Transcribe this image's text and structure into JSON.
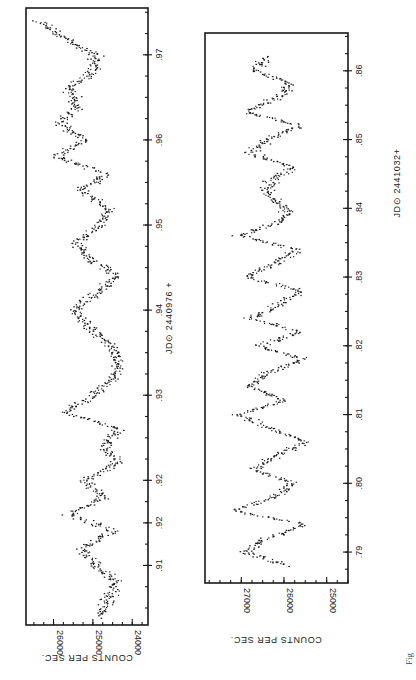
{
  "figure": {
    "orientation": "rotated 90 degrees clockwise",
    "caption_fragment": "Fig"
  },
  "chart_data": [
    {
      "type": "scatter",
      "title": "",
      "xlabel": "JD⊙ 2440976 +",
      "ylabel": "COUNTS PER SEC.",
      "x_ticks": [
        ".91",
        ".92",
        ".92",
        ".93",
        ".94",
        ".95",
        ".96",
        ".97"
      ],
      "x_tick_values": [
        0.91,
        0.915,
        0.92,
        0.93,
        0.94,
        0.95,
        0.96,
        0.97
      ],
      "y_ticks": [
        "24000",
        "25000",
        "26000"
      ],
      "xlim": [
        0.903,
        0.9755
      ],
      "ylim": [
        23600,
        26700
      ],
      "grid": false,
      "legend": null,
      "description": "Light curve showing quasi-periodic oscillations of ~0.01 day with amplitude ~800 counts/sec around 25000",
      "series": [
        {
          "name": "Run 1",
          "x": [
            0.904,
            0.906,
            0.908,
            0.91,
            0.912,
            0.914,
            0.916,
            0.918,
            0.92,
            0.922,
            0.924,
            0.926,
            0.928,
            0.93,
            0.932,
            0.934,
            0.936,
            0.938,
            0.94,
            0.942,
            0.944,
            0.946,
            0.948,
            0.95,
            0.952,
            0.954,
            0.956,
            0.958,
            0.96,
            0.962,
            0.964,
            0.966,
            0.968,
            0.97,
            0.972,
            0.974
          ],
          "y": [
            24800,
            24600,
            24400,
            24900,
            25300,
            24500,
            25600,
            24700,
            25200,
            24400,
            24700,
            24300,
            25700,
            25000,
            24500,
            24300,
            24600,
            25100,
            25500,
            24900,
            24400,
            25100,
            25400,
            24800,
            24600,
            25300,
            24700,
            25900,
            25200,
            25800,
            25400,
            25600,
            25000,
            24900,
            25700,
            26400
          ]
        }
      ]
    },
    {
      "type": "scatter",
      "title": "",
      "xlabel": "JD⊙ 2441032+",
      "ylabel": "COUNTS PER SEC.",
      "x_ticks": [
        ".79",
        ".80",
        ".81",
        ".82",
        ".83",
        ".84",
        ".85",
        ".86"
      ],
      "x_tick_values": [
        0.79,
        0.8,
        0.81,
        0.82,
        0.83,
        0.84,
        0.85,
        0.86
      ],
      "y_ticks": [
        "25000",
        "26000",
        "27000"
      ],
      "xlim": [
        0.7855,
        0.8655
      ],
      "ylim": [
        24500,
        27850
      ],
      "grid": false,
      "legend": null,
      "description": "Light curve showing rapid quasi-periodic oscillations of ~0.005 day with amplitude ~1200 counts/sec around 26000",
      "series": [
        {
          "name": "Run 2",
          "x": [
            0.788,
            0.79,
            0.792,
            0.794,
            0.796,
            0.798,
            0.8,
            0.802,
            0.804,
            0.806,
            0.808,
            0.81,
            0.812,
            0.814,
            0.816,
            0.818,
            0.82,
            0.822,
            0.824,
            0.826,
            0.828,
            0.83,
            0.832,
            0.834,
            0.836,
            0.838,
            0.84,
            0.842,
            0.844,
            0.846,
            0.848,
            0.85,
            0.852,
            0.854,
            0.856,
            0.858,
            0.86,
            0.862
          ],
          "y": [
            26000,
            26900,
            26400,
            25500,
            27200,
            26200,
            25800,
            26700,
            26200,
            25500,
            26300,
            27100,
            26000,
            26800,
            26400,
            25500,
            26600,
            25600,
            26800,
            26100,
            25600,
            26900,
            26200,
            25700,
            27000,
            26100,
            25900,
            26400,
            26300,
            25800,
            26800,
            26400,
            25600,
            26900,
            26200,
            25800,
            26700,
            26400
          ]
        }
      ]
    }
  ],
  "panels": {
    "left": {
      "y_axis_label": "COUNTS PER SEC.",
      "y_ticks": [
        "26000",
        "25000",
        "24000"
      ],
      "x_ticks": [
        ".91",
        ".92",
        ".92",
        ".93",
        ".94",
        ".95",
        ".96",
        ".97"
      ],
      "x_axis_label": "JD⊙ 2440976 +"
    },
    "right": {
      "y_axis_label": "COUNTS PER SEC.",
      "y_ticks": [
        "27000",
        "26000",
        "25000"
      ],
      "x_ticks": [
        ".79",
        ".80",
        ".81",
        ".82",
        ".83",
        ".84",
        ".85",
        ".86"
      ],
      "x_axis_label": "JD⊙ 2441032+"
    }
  }
}
